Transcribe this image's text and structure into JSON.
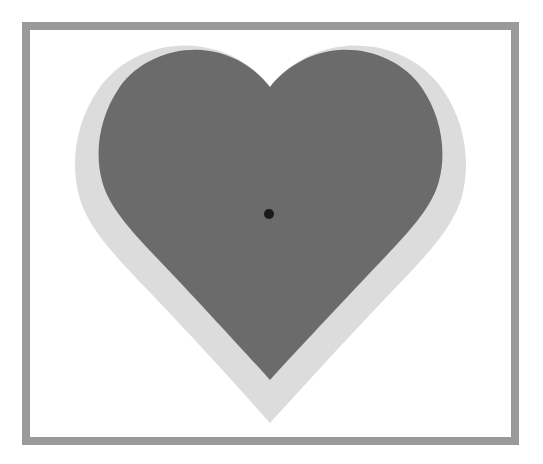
{
  "image": {
    "title": "Gray heart with white border and gray frame",
    "width": 543,
    "height": 464,
    "background_color": "#ffffff"
  },
  "frame": {
    "name": "outer-frame",
    "color": "#9a9a9a",
    "thickness_px": 8,
    "left": 22,
    "top": 22,
    "width": 497,
    "height": 423
  },
  "matte": {
    "name": "white-matte",
    "color": "#ffffff"
  },
  "heart": {
    "outline": {
      "label": "light gray heart outline",
      "color": "#dcdcdc",
      "left": 76,
      "right": 465,
      "top": 45,
      "bottom_point_y": 423,
      "cleft_y": 85
    },
    "body": {
      "label": "dark gray heart body",
      "color": "#6b6b6b",
      "left": 96,
      "right": 447,
      "top": 67,
      "bottom_point_y": 380,
      "cleft_y": 128
    },
    "center_dot": {
      "label": "black center dot",
      "color": "#1a1a1a",
      "cx": 269,
      "cy": 214,
      "radius": 5
    }
  }
}
